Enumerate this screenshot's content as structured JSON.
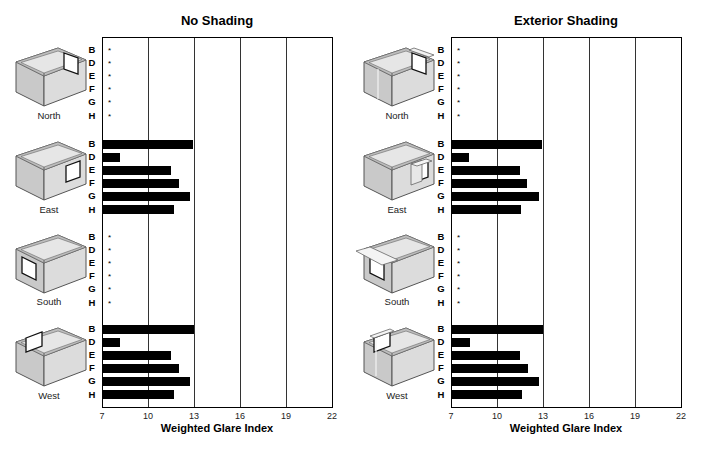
{
  "header_clip": "",
  "axis": {
    "xlabel": "Weighted Glare Index",
    "ticks": [
      "7",
      "10",
      "13",
      "16",
      "19",
      "22"
    ],
    "min": 7,
    "max": 22
  },
  "row_labels": [
    "B",
    "D",
    "E",
    "F",
    "G",
    "H"
  ],
  "star_symbol": "*",
  "panels": [
    {
      "title": "No Shading",
      "sections": [
        {
          "orientation": "North",
          "values": [
            null,
            null,
            null,
            null,
            null,
            null
          ]
        },
        {
          "orientation": "East",
          "values": [
            12.9,
            8.1,
            11.45,
            11.95,
            12.7,
            11.6
          ]
        },
        {
          "orientation": "South",
          "values": [
            null,
            null,
            null,
            null,
            null,
            null
          ]
        },
        {
          "orientation": "West",
          "values": [
            12.95,
            8.1,
            11.45,
            11.95,
            12.7,
            11.6
          ]
        }
      ]
    },
    {
      "title": "Exterior Shading",
      "sections": [
        {
          "orientation": "North",
          "values": [
            null,
            null,
            null,
            null,
            null,
            null
          ]
        },
        {
          "orientation": "East",
          "values": [
            12.9,
            8.1,
            11.45,
            11.9,
            12.65,
            11.5
          ]
        },
        {
          "orientation": "South",
          "values": [
            null,
            null,
            null,
            null,
            null,
            null
          ]
        },
        {
          "orientation": "West",
          "values": [
            12.95,
            8.15,
            11.45,
            11.95,
            12.65,
            11.55
          ]
        }
      ]
    }
  ],
  "chart_data": [
    {
      "type": "bar",
      "orientation": "horizontal",
      "title": "No Shading",
      "xlabel": "Weighted Glare Index",
      "ylabel": "",
      "xlim": [
        7,
        22
      ],
      "xticks": [
        7,
        10,
        13,
        16,
        19,
        22
      ],
      "grid": "vertical gridlines at each tick",
      "groups": [
        "North",
        "East",
        "South",
        "West"
      ],
      "categories": [
        "B",
        "D",
        "E",
        "F",
        "G",
        "H"
      ],
      "series": [
        {
          "name": "North",
          "values": [
            null,
            null,
            null,
            null,
            null,
            null
          ],
          "note": "* (no value shown)"
        },
        {
          "name": "East",
          "values": [
            12.9,
            8.1,
            11.45,
            11.95,
            12.7,
            11.6
          ]
        },
        {
          "name": "South",
          "values": [
            null,
            null,
            null,
            null,
            null,
            null
          ],
          "note": "* (no value shown)"
        },
        {
          "name": "West",
          "values": [
            12.95,
            8.1,
            11.45,
            11.95,
            12.7,
            11.6
          ]
        }
      ]
    },
    {
      "type": "bar",
      "orientation": "horizontal",
      "title": "Exterior Shading",
      "xlabel": "Weighted Glare Index",
      "ylabel": "",
      "xlim": [
        7,
        22
      ],
      "xticks": [
        7,
        10,
        13,
        16,
        19,
        22
      ],
      "grid": "vertical gridlines at each tick",
      "groups": [
        "North",
        "East",
        "South",
        "West"
      ],
      "categories": [
        "B",
        "D",
        "E",
        "F",
        "G",
        "H"
      ],
      "series": [
        {
          "name": "North",
          "values": [
            null,
            null,
            null,
            null,
            null,
            null
          ],
          "note": "* (no value shown)"
        },
        {
          "name": "East",
          "values": [
            12.9,
            8.1,
            11.45,
            11.9,
            12.65,
            11.5
          ]
        },
        {
          "name": "South",
          "values": [
            null,
            null,
            null,
            null,
            null,
            null
          ],
          "note": "* (no value shown)"
        },
        {
          "name": "West",
          "values": [
            12.95,
            8.15,
            11.45,
            11.95,
            12.65,
            11.55
          ]
        }
      ]
    }
  ]
}
